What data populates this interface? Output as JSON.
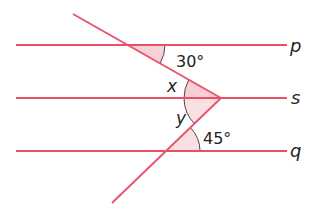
{
  "diagram": {
    "type": "parallel-lines-angles",
    "colors": {
      "line": "#e8506a",
      "fill": "#f7c9d0",
      "text": "#231f20",
      "arc": "#231f20"
    },
    "lines": [
      {
        "name": "p",
        "label": "p",
        "y": 45
      },
      {
        "name": "s",
        "label": "s",
        "y": 98
      },
      {
        "name": "q",
        "label": "q",
        "y": 151
      }
    ],
    "angles": [
      {
        "name": "angle-30",
        "label": "30°"
      },
      {
        "name": "angle-x",
        "label": "x"
      },
      {
        "name": "angle-y",
        "label": "y"
      },
      {
        "name": "angle-45",
        "label": "45°"
      }
    ]
  }
}
